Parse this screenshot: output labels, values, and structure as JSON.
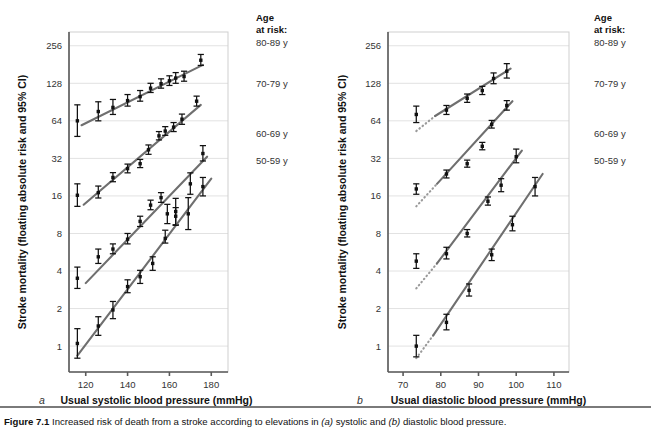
{
  "figure": {
    "number": "Figure 7.1",
    "caption_pre": "Increased risk of death from a stroke according to elevations in ",
    "caption_a_tag": "(a)",
    "caption_mid": " systolic and ",
    "caption_b_tag": "(b)",
    "caption_post": " diastolic blood pressure."
  },
  "legend": {
    "title_line1": "Age",
    "title_line2": "at risk:",
    "items": [
      {
        "label": "80-89 y",
        "y": 42
      },
      {
        "label": "70-79 y",
        "y": 83
      },
      {
        "label": "60-69 y",
        "y": 133
      },
      {
        "label": "50-59 y",
        "y": 160
      }
    ]
  },
  "shared": {
    "ylabel": "Stroke mortality (floating absolute risk and 95% CI)",
    "yticks": [
      1,
      2,
      4,
      8,
      16,
      32,
      64,
      128,
      256
    ],
    "ylim": [
      0.62,
      330
    ],
    "yscale": "log2",
    "grid": true,
    "legend_position": "right-outside"
  },
  "chart_data": [
    {
      "id": "panel-a",
      "type": "scatter",
      "panel_letter": "a",
      "title": "",
      "xlabel": "Usual systolic blood pressure (mmHg)",
      "ylabel": "Stroke mortality (floating absolute risk and 95% CI)",
      "xticks": [
        120,
        140,
        160,
        180
      ],
      "xlim": [
        112,
        188
      ],
      "ylim": [
        0.62,
        330
      ],
      "yscale": "log2",
      "series": [
        {
          "name": "80-89 y",
          "x": [
            116,
            126,
            133,
            140,
            146,
            151,
            156,
            160,
            163,
            167,
            175
          ],
          "values": [
            64,
            76,
            82,
            93,
            100,
            117,
            127,
            134,
            141,
            145,
            196
          ],
          "ci_low": [
            48,
            64,
            72,
            84,
            92,
            108,
            117,
            123,
            128,
            133,
            178
          ],
          "ci_high": [
            86,
            91,
            95,
            104,
            112,
            128,
            139,
            147,
            156,
            160,
            218
          ],
          "fit_x": [
            118,
            176
          ],
          "fit_y": [
            59,
            180
          ],
          "fit_dotted_x": [],
          "fit_dotted_y": []
        },
        {
          "name": "70-79 y",
          "x": [
            116,
            126,
            133,
            140,
            146,
            150,
            155,
            158,
            162,
            166,
            173
          ],
          "values": [
            16.2,
            17.0,
            22.5,
            26.5,
            29.0,
            37.5,
            48.5,
            53.0,
            57.0,
            66.0,
            92.0
          ],
          "ci_low": [
            13.2,
            15.4,
            20.8,
            24.5,
            27.0,
            34.5,
            45.0,
            49.0,
            52.5,
            60.0,
            84.0
          ],
          "ci_high": [
            20.0,
            19.2,
            24.6,
            28.8,
            31.4,
            41.0,
            52.5,
            57.5,
            62.0,
            72.5,
            101.0
          ],
          "fit_x": [
            119,
            175
          ],
          "fit_y": [
            13.6,
            86.0
          ],
          "fit_dotted_x": [],
          "fit_dotted_y": []
        },
        {
          "name": "60-69 y",
          "x": [
            116,
            126,
            133,
            140,
            146,
            151,
            156,
            159,
            163,
            170,
            176
          ],
          "values": [
            3.5,
            5.2,
            6.0,
            7.2,
            10.0,
            13.5,
            15.5,
            11.5,
            12.0,
            20.0,
            35.0
          ],
          "ci_low": [
            2.9,
            4.6,
            5.5,
            6.6,
            9.1,
            12.4,
            14.2,
            9.6,
            9.4,
            16.5,
            30.5
          ],
          "ci_high": [
            4.3,
            6.0,
            6.6,
            8.0,
            11.0,
            14.8,
            17.0,
            13.7,
            15.3,
            24.5,
            40.5
          ],
          "fit_x": [
            120,
            178
          ],
          "fit_y": [
            3.2,
            33.0
          ],
          "fit_dotted_x": [],
          "fit_dotted_y": []
        },
        {
          "name": "50-59 y",
          "x": [
            116,
            126,
            133,
            140,
            146,
            152,
            158,
            163,
            169,
            176
          ],
          "values": [
            1.05,
            1.45,
            1.95,
            3.0,
            3.6,
            4.6,
            7.3,
            11.0,
            11.5,
            19.0
          ],
          "ci_low": [
            0.8,
            1.22,
            1.66,
            2.68,
            3.18,
            4.05,
            6.7,
            9.3,
            8.6,
            16.0
          ],
          "ci_high": [
            1.38,
            1.72,
            2.28,
            3.4,
            4.05,
            5.2,
            8.5,
            12.9,
            15.5,
            22.5
          ],
          "fit_x": [
            116,
            180
          ],
          "fit_y": [
            0.84,
            22.0
          ],
          "fit_dotted_x": [],
          "fit_dotted_y": []
        }
      ]
    },
    {
      "id": "panel-b",
      "type": "scatter",
      "panel_letter": "b",
      "title": "",
      "xlabel": "Usual diastolic blood pressure (mmHg)",
      "ylabel": "Stroke mortality (floating absolute risk and 95% CI)",
      "xticks": [
        70,
        80,
        90,
        100,
        110
      ],
      "xlim": [
        66,
        114
      ],
      "ylim": [
        0.62,
        330
      ],
      "yscale": "log2",
      "series": [
        {
          "name": "80-89 y",
          "x": [
            73.5,
            81.5,
            87,
            91,
            94,
            97.5
          ],
          "values": [
            72,
            78,
            97,
            112,
            140,
            160
          ],
          "ci_low": [
            62,
            72,
            90,
            104,
            127,
            141
          ],
          "ci_high": [
            84,
            85,
            105,
            121,
            155,
            184
          ],
          "fit_x": [
            78.5,
            98.5
          ],
          "fit_y": [
            70,
            168
          ],
          "fit_dotted_x": [
            73.5,
            78.5
          ],
          "fit_dotted_y": [
            53,
            70
          ]
        },
        {
          "name": "70-79 y",
          "x": [
            73.5,
            81.5,
            87,
            91,
            93.5,
            97.5
          ],
          "values": [
            18.2,
            24.0,
            29.0,
            40.0,
            60.0,
            85.0
          ],
          "ci_low": [
            16.5,
            22.3,
            27.2,
            37.5,
            56.0,
            78.0
          ],
          "ci_high": [
            20.0,
            25.8,
            31.0,
            43.0,
            64.5,
            93.0
          ],
          "fit_x": [
            79,
            99
          ],
          "fit_y": [
            20.0,
            92.0
          ],
          "fit_dotted_x": [
            73.5,
            79
          ],
          "fit_dotted_y": [
            13.2,
            20.0
          ]
        },
        {
          "name": "60-69 y",
          "x": [
            73.5,
            81.5,
            87,
            92.5,
            96,
            100
          ],
          "values": [
            4.8,
            5.5,
            8.0,
            14.5,
            19.5,
            33.0
          ],
          "ci_low": [
            4.2,
            5.0,
            7.5,
            13.5,
            17.3,
            29.5
          ],
          "ci_high": [
            5.5,
            6.2,
            8.6,
            15.7,
            22.0,
            38.0
          ],
          "fit_x": [
            79,
            101.5
          ],
          "fit_y": [
            4.6,
            37.0
          ],
          "fit_dotted_x": [
            73.5,
            79
          ],
          "fit_dotted_y": [
            2.9,
            4.6
          ]
        },
        {
          "name": "50-59 y",
          "x": [
            73.5,
            81.5,
            87.5,
            93.5,
            99,
            105
          ],
          "values": [
            1.0,
            1.55,
            2.8,
            5.4,
            9.4,
            19.0
          ],
          "ci_low": [
            0.82,
            1.35,
            2.52,
            4.85,
            8.4,
            16.0
          ],
          "ci_high": [
            1.22,
            1.8,
            3.15,
            6.0,
            11.0,
            22.5
          ],
          "fit_x": [
            78,
            107
          ],
          "fit_y": [
            1.22,
            24.0
          ],
          "fit_dotted_x": [
            73.5,
            78
          ],
          "fit_dotted_y": [
            0.8,
            1.22
          ]
        }
      ]
    }
  ]
}
